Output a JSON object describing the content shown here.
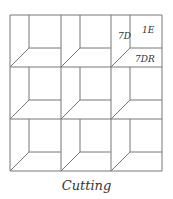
{
  "diagram": {
    "caption": "Cutting",
    "grid": {
      "rows": 3,
      "cols": 3,
      "x": [
        10,
        61,
        111,
        162
      ],
      "y": [
        15,
        67,
        119,
        171
      ]
    },
    "labels": [
      {
        "text": "7D",
        "x": 118,
        "y": 39
      },
      {
        "text": "1E",
        "x": 142,
        "y": 33
      },
      {
        "text": "7DR",
        "x": 135,
        "y": 62
      }
    ],
    "line_color": "#777777"
  }
}
